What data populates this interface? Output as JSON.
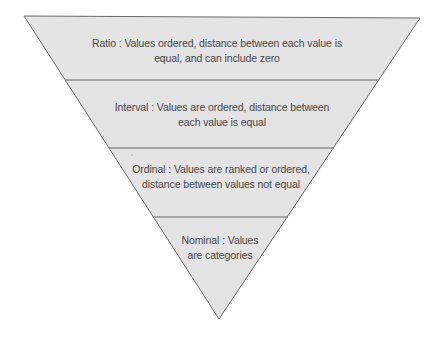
{
  "diagram": {
    "shape": "inverted-pyramid",
    "colors": {
      "fill": "#e4e4e4",
      "stroke": "#6a6a6a",
      "text": "#474747",
      "background": "#ffffff"
    },
    "levels": [
      {
        "name": "Ratio",
        "line1": "Ratio : Values ordered, distance between each value is",
        "line2": "equal, and can include zero"
      },
      {
        "name": "Interval",
        "line1": "Interval : Values are ordered, distance between",
        "line2": "each value is equal"
      },
      {
        "name": "Ordinal",
        "line1": "Ordinal : Values are ranked or ordered,",
        "line2": "distance between values not equal"
      },
      {
        "name": "Nominal",
        "line1": "Nominal : Values",
        "line2": "are categories"
      }
    ]
  }
}
